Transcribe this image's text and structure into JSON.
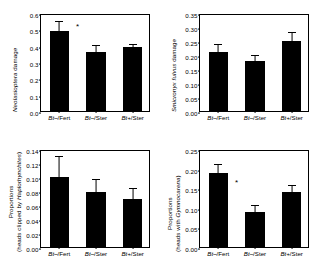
{
  "figure": {
    "panels": [
      {
        "id": "neolasioptera-damage",
        "chart_data": {
          "type": "bar",
          "title": "",
          "xlabel": "",
          "ylabel": "Neolasioptera damage",
          "ylabel_italic_part": "Neolasioptera",
          "ylabel_plain_part": " damage",
          "categories": [
            "Bt–/Fert",
            "Bt–/Ster",
            "Bt+/Ster"
          ],
          "values": [
            0.49,
            0.36,
            0.39
          ],
          "errors": [
            0.075,
            0.055,
            0.035
          ],
          "ylim": [
            0.0,
            0.6
          ],
          "yticks": [
            0.0,
            0.1,
            0.2,
            0.3,
            0.4,
            0.5,
            0.6
          ],
          "ytick_labels": [
            "0.0",
            "0.1",
            "0.2",
            "0.3",
            "0.4",
            "0.5",
            "0.6"
          ],
          "grid": false,
          "legend": "none",
          "annotations": [
            {
              "text": "*",
              "x_category_gap": 0.5,
              "y": 0.525
            }
          ]
        }
      },
      {
        "id": "smicronyx-fulvus-damage",
        "chart_data": {
          "type": "bar",
          "title": "",
          "xlabel": "",
          "ylabel": "Smicronyx fulvus damage",
          "ylabel_italic_part": "Smicronyx fulvus",
          "ylabel_plain_part": " damage",
          "categories": [
            "Bt–/Fert",
            "Bt–/Ster",
            "Bt+/Ster"
          ],
          "values": [
            0.21,
            0.18,
            0.25
          ],
          "errors": [
            0.035,
            0.027,
            0.04
          ],
          "ylim": [
            0.0,
            0.35
          ],
          "yticks": [
            0.0,
            0.05,
            0.1,
            0.15,
            0.2,
            0.25,
            0.3,
            0.35
          ],
          "ytick_labels": [
            "0.00",
            "0.05",
            "0.10",
            "0.15",
            "0.20",
            "0.25",
            "0.30",
            "0.35"
          ],
          "grid": false,
          "legend": "none",
          "annotations": []
        }
      },
      {
        "id": "proportions-haplorhynchites",
        "chart_data": {
          "type": "bar",
          "title": "",
          "xlabel": "",
          "ylabel": "Proportions (heads clipped by Haplorhynchites)",
          "ylabel_line1": "Proportions",
          "ylabel_line2_prefix": "(heads clipped by ",
          "ylabel_line2_italic": "Haplorhynchites",
          "ylabel_line2_suffix": ")",
          "categories": [
            "Bt–/Fert",
            "Bt–/Ster",
            "Bt+/Ster"
          ],
          "values": [
            0.1,
            0.079,
            0.069
          ],
          "errors": [
            0.033,
            0.021,
            0.018
          ],
          "ylim": [
            0.0,
            0.14
          ],
          "yticks": [
            0.0,
            0.02,
            0.04,
            0.06,
            0.08,
            0.1,
            0.12,
            0.14
          ],
          "ytick_labels": [
            "0.00",
            "0.02",
            "0.04",
            "0.06",
            "0.08",
            "0.10",
            "0.12",
            "0.14"
          ],
          "grid": false,
          "legend": "none",
          "annotations": []
        }
      },
      {
        "id": "proportions-gymnocarena",
        "chart_data": {
          "type": "bar",
          "title": "",
          "xlabel": "",
          "ylabel": "Proportions (heads with Gymnocarena)",
          "ylabel_line1": "Proportions",
          "ylabel_line2_prefix": "(heads with ",
          "ylabel_line2_italic": "Gymnocarena",
          "ylabel_line2_suffix": ")",
          "categories": [
            "Bt–/Fert",
            "Bt–/Ster",
            "Bt+/Ster"
          ],
          "values": [
            0.19,
            0.09,
            0.14
          ],
          "errors": [
            0.027,
            0.022,
            0.022
          ],
          "ylim": [
            0.0,
            0.25
          ],
          "yticks": [
            0.0,
            0.05,
            0.1,
            0.15,
            0.2,
            0.25
          ],
          "ytick_labels": [
            "0.00",
            "0.05",
            "0.10",
            "0.15",
            "0.20",
            "0.25"
          ],
          "grid": false,
          "legend": "none",
          "annotations": [
            {
              "text": "*",
              "x_category_gap": 0.5,
              "y": 0.168
            }
          ]
        }
      }
    ]
  }
}
